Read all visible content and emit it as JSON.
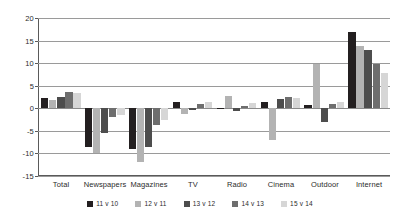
{
  "chart_data": {
    "type": "bar",
    "title": "",
    "subtitle": "",
    "xlabel": "",
    "ylabel": "",
    "ylim": [
      -15,
      20
    ],
    "ytick_values": [
      20,
      15,
      10,
      5,
      0,
      -5,
      -10,
      -15
    ],
    "ytick_labels": [
      "20",
      "15",
      "10",
      "5",
      "0",
      "-5",
      "-10",
      "-15"
    ],
    "grid": "horizontal",
    "legend_position": "bottom",
    "categories": [
      "Total",
      "Newspapers",
      "Magazines",
      "TV",
      "Radio",
      "Cinema",
      "Outdoor",
      "Internet"
    ],
    "series": [
      {
        "name": "11 v 10",
        "color": "#231f20",
        "values": [
          2.3,
          -8.6,
          -9.0,
          1.3,
          -0.2,
          1.5,
          0.8,
          16.8
        ]
      },
      {
        "name": "12 v 11",
        "color": "#b3b3b3",
        "values": [
          1.8,
          -9.8,
          -11.9,
          -1.2,
          2.8,
          -7.0,
          9.8,
          13.8
        ]
      },
      {
        "name": "13 v 12",
        "color": "#4d4d4d",
        "values": [
          2.6,
          -5.4,
          -8.6,
          -0.4,
          -0.6,
          2.0,
          -3.0,
          12.9
        ]
      },
      {
        "name": "14 v 13",
        "color": "#6e6e6e",
        "values": [
          3.6,
          -1.9,
          -3.8,
          0.9,
          0.5,
          2.6,
          0.9,
          9.7
        ]
      },
      {
        "name": "15 v 14",
        "color": "#d6d6d6",
        "values": [
          3.4,
          -1.4,
          -2.5,
          1.3,
          1.2,
          2.2,
          1.4,
          7.8
        ]
      }
    ]
  },
  "axis": {
    "y_top_label": "20",
    "y_bottom_label": "-15"
  }
}
